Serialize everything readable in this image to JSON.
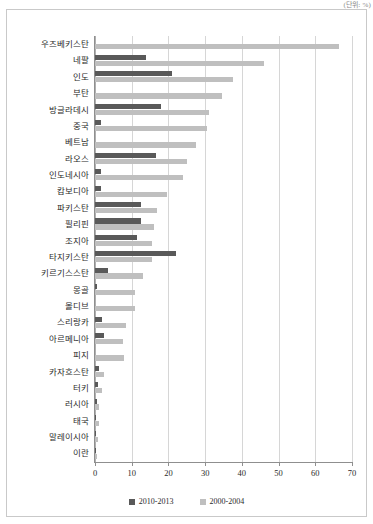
{
  "caption": {
    "unit_note": "(단위: %)"
  },
  "chart_data": {
    "type": "bar",
    "orientation": "horizontal",
    "title": "",
    "subtitle": "",
    "xlabel": "",
    "ylabel": "",
    "xlim": [
      0,
      70
    ],
    "xticks": [
      0,
      10,
      20,
      30,
      40,
      50,
      60,
      70
    ],
    "grid": true,
    "legend_position": "bottom",
    "categories": [
      "우즈베키스탄",
      "네팔",
      "인도",
      "부탄",
      "방글라데시",
      "중국",
      "베트남",
      "라오스",
      "인도네시아",
      "캄보디아",
      "파키스탄",
      "필리핀",
      "조지아",
      "타지키스탄",
      "키르기스스탄",
      "몽골",
      "몰디브",
      "스리랑카",
      "아르메니아",
      "피지",
      "카자흐스탄",
      "터키",
      "러시아",
      "태국",
      "말레이시아",
      "이란"
    ],
    "series": [
      {
        "name": "2010-2013",
        "color": "#595959",
        "values": [
          0,
          14.0,
          21.0,
          0,
          18.0,
          1.5,
          0,
          16.5,
          1.5,
          1.5,
          12.5,
          12.5,
          11.5,
          22.0,
          3.5,
          0.5,
          0,
          2.0,
          2.5,
          0,
          1.0,
          0.8,
          0.5,
          0.3,
          0.3,
          0.2
        ]
      },
      {
        "name": "2000-2004",
        "color": "#bfbfbf",
        "values": [
          66.5,
          46.0,
          37.5,
          34.5,
          31.0,
          30.5,
          27.5,
          25.0,
          24.0,
          19.5,
          17.0,
          16.0,
          15.5,
          15.5,
          13.0,
          11.0,
          11.0,
          8.5,
          7.5,
          8.0,
          2.5,
          1.8,
          1.2,
          1.0,
          0.8,
          0.6
        ]
      }
    ]
  },
  "legend": {
    "items": [
      {
        "label": "2010-2013"
      },
      {
        "label": "2000-2004"
      }
    ]
  }
}
